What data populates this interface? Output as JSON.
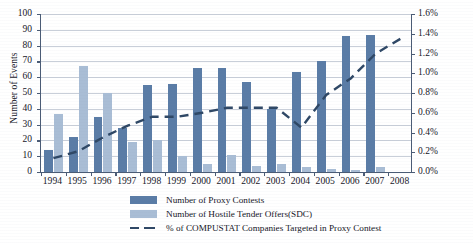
{
  "chart_data": {
    "type": "bar",
    "title": "",
    "xlabel": "",
    "ylabel": "Number of Events",
    "ylabel_right": "% of COMPUSTAT Companies",
    "ylim": [
      0,
      100
    ],
    "ylim_right": [
      0,
      1.6
    ],
    "grid": true,
    "legend_position": "bottom",
    "categories": [
      "1994",
      "1995",
      "1996",
      "1997",
      "1998",
      "1999",
      "2000",
      "2001",
      "2002",
      "2003",
      "2004",
      "2005",
      "2006",
      "2007",
      "2008"
    ],
    "yticks": [
      "0",
      "10",
      "20",
      "30",
      "40",
      "50",
      "60",
      "70",
      "80",
      "90",
      "100"
    ],
    "yticks_right": [
      "0.0%",
      "0.2%",
      "0.4%",
      "0.6%",
      "0.8%",
      "1.0%",
      "1.2%",
      "1.4%",
      "1.6%"
    ],
    "series": [
      {
        "name": "Number of Proxy Contests",
        "type": "bar",
        "color": "#5a7ca6",
        "axis": "left",
        "values": [
          14,
          22,
          35,
          28,
          55,
          56,
          66,
          66,
          57,
          40,
          63,
          70,
          86,
          87,
          null
        ]
      },
      {
        "name": "Number of Hostile Tender Offers(SDC)",
        "type": "bar",
        "color": "#a9bdd5",
        "axis": "left",
        "values": [
          37,
          67,
          50,
          19,
          20,
          10,
          5,
          11,
          4,
          5,
          3,
          2,
          1,
          3,
          null
        ]
      },
      {
        "name": "% of COMPUSTAT Companies Targeted in Proxy Contest",
        "type": "line",
        "style": "dashed",
        "color": "#2e4765",
        "axis": "right",
        "values": [
          0.14,
          0.21,
          0.35,
          0.47,
          0.56,
          0.56,
          0.6,
          0.65,
          0.65,
          0.65,
          0.45,
          0.78,
          0.95,
          1.2,
          1.35
        ]
      }
    ]
  },
  "legend": {
    "items": [
      {
        "label": "Number of Proxy Contests",
        "marker": "dark-swatch"
      },
      {
        "label": "Number of Hostile Tender Offers(SDC)",
        "marker": "light-swatch"
      },
      {
        "label": "% of COMPUSTAT Companies Targeted in Proxy Contest",
        "marker": "dashed-line"
      }
    ]
  }
}
